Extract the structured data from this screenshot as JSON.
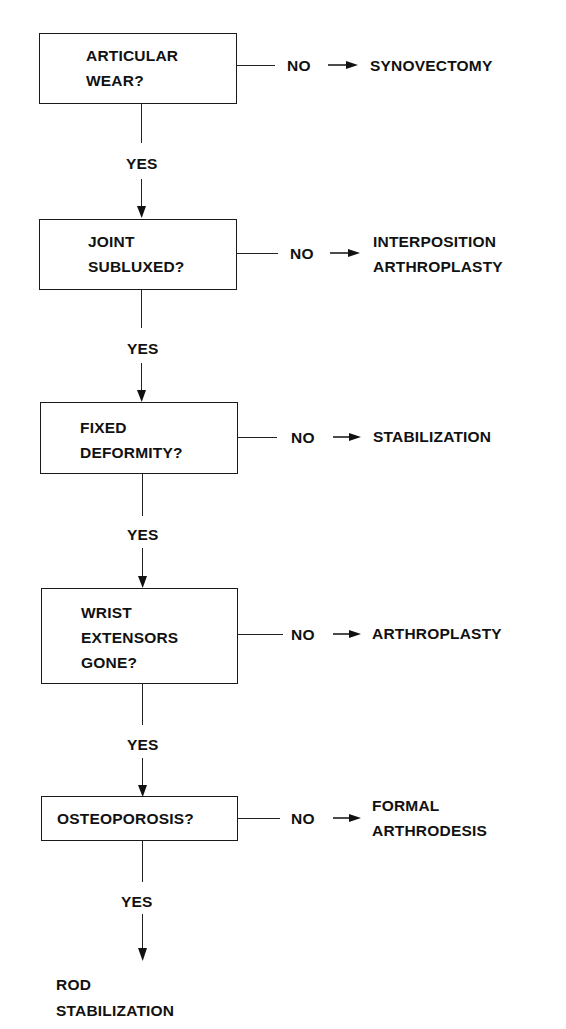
{
  "diagram": {
    "type": "decision-flowchart",
    "decisions": [
      {
        "question": "ARTICULAR\nWEAR?",
        "yes_label": "YES",
        "no_label": "NO",
        "no_outcome": "SYNOVECTOMY"
      },
      {
        "question": "JOINT\nSUBLUXED?",
        "yes_label": "YES",
        "no_label": "NO",
        "no_outcome": "INTERPOSITION\nARTHROPLASTY"
      },
      {
        "question": "FIXED\nDEFORMITY?",
        "yes_label": "YES",
        "no_label": "NO",
        "no_outcome": "STABILIZATION"
      },
      {
        "question": "WRIST\nEXTENSORS\nGONE?",
        "yes_label": "YES",
        "no_label": "NO",
        "no_outcome": "ARTHROPLASTY"
      },
      {
        "question": "OSTEOPOROSIS?",
        "yes_label": "YES",
        "no_label": "NO",
        "no_outcome": "FORMAL\nARTHRODESIS"
      }
    ],
    "final_outcome": "ROD\nSTABILIZATION",
    "colors": {
      "ink": "#111111",
      "background": "#ffffff"
    }
  }
}
